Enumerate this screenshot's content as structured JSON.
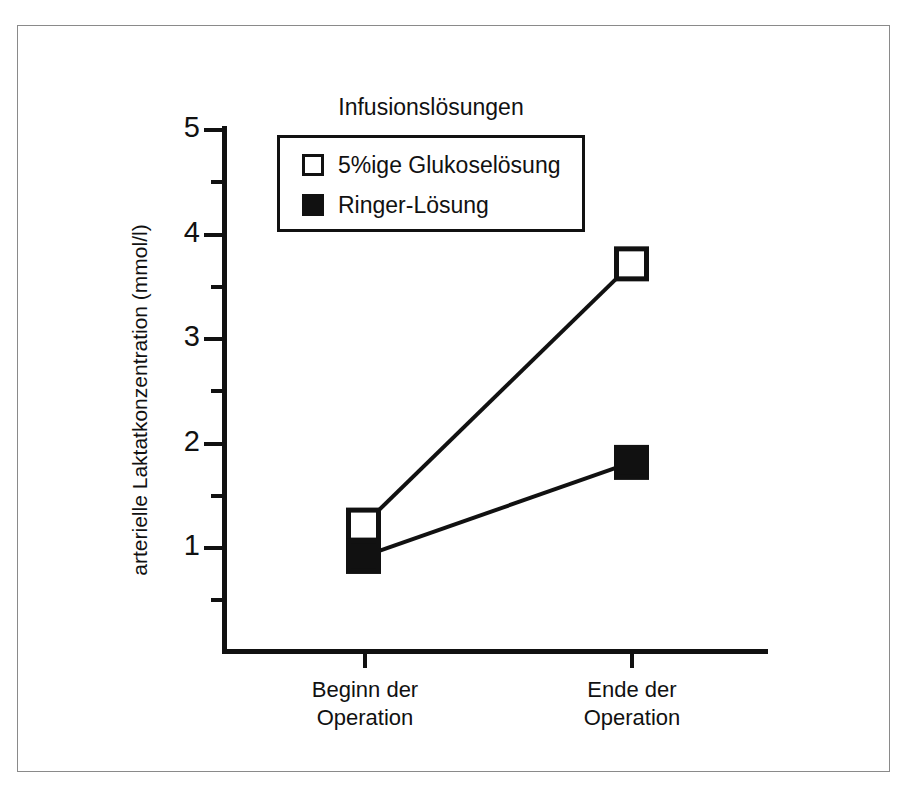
{
  "figure": {
    "frame_color": "#8a8a8a",
    "background": "#ffffff"
  },
  "legend": {
    "title": "Infusionslösungen",
    "entries": [
      {
        "label": "5%ige Glukoselösung",
        "marker": "open-square",
        "color": "#ffffff"
      },
      {
        "label": "Ringer-Lösung",
        "marker": "filled-square",
        "color": "#111111"
      }
    ]
  },
  "axes": {
    "y_title": "arterielle Laktatkonzentration (mmol/l)",
    "y_ticks": [
      "1",
      "2",
      "3",
      "4",
      "5"
    ],
    "x_ticks": [
      "Beginn der\nOperation",
      "Ende der\nOperation"
    ],
    "x_tick_line1": [
      "Beginn der",
      "Ende der"
    ],
    "x_tick_line2": [
      "Operation",
      "Operation"
    ]
  },
  "chart_data": {
    "type": "line",
    "title": "",
    "subtitle": "",
    "xlabel": "",
    "ylabel": "arterielle Laktatkonzentration (mmol/l)",
    "categories": [
      "Beginn der Operation",
      "Ende der Operation"
    ],
    "ylim": [
      0,
      5
    ],
    "yticks": [
      1,
      2,
      3,
      4,
      5
    ],
    "yminorticks": [
      0.5,
      1.5,
      2.5,
      3.5,
      4.5
    ],
    "grid": false,
    "legend_position": "upper-center",
    "legend_title": "Infusionslösungen",
    "series": [
      {
        "name": "5%ige Glukoselösung",
        "marker": "open-square",
        "marker_fill": "#ffffff",
        "marker_edge": "#111111",
        "line_color": "#111111",
        "values": [
          1.2,
          3.7
        ]
      },
      {
        "name": "Ringer-Lösung",
        "marker": "filled-square",
        "marker_fill": "#111111",
        "marker_edge": "#111111",
        "line_color": "#111111",
        "values": [
          0.9,
          1.8
        ]
      }
    ]
  }
}
